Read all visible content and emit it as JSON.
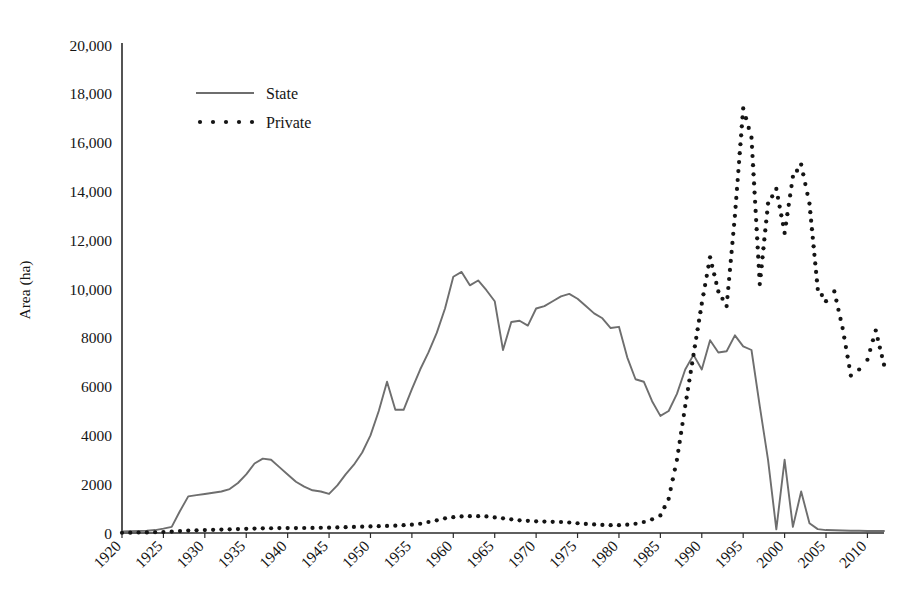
{
  "chart_data": {
    "type": "line",
    "title": "",
    "xlabel": "",
    "ylabel": "Area (ha)",
    "xlim": [
      1920,
      2012
    ],
    "ylim": [
      0,
      20000
    ],
    "grid": false,
    "legend_position": "top-left",
    "y_ticks": [
      0,
      2000,
      4000,
      6000,
      8000,
      10000,
      12000,
      14000,
      16000,
      18000,
      20000
    ],
    "y_tick_labels": [
      "0",
      "2000",
      "4000",
      "6000",
      "8000",
      "10,000",
      "12,000",
      "14,000",
      "16,000",
      "18,000",
      "20,000"
    ],
    "x_ticks": [
      1920,
      1925,
      1930,
      1935,
      1940,
      1945,
      1950,
      1955,
      1960,
      1965,
      1970,
      1975,
      1980,
      1985,
      1990,
      1995,
      2000,
      2005,
      2010
    ],
    "x_tick_labels": [
      "1920",
      "1925",
      "1930",
      "1935",
      "1940",
      "1945",
      "1950",
      "1955",
      "1960",
      "1965",
      "1970",
      "1975",
      "1980",
      "1985",
      "1990",
      "1995",
      "2000",
      "2005",
      "2010"
    ],
    "x": [
      1920,
      1921,
      1922,
      1923,
      1924,
      1925,
      1926,
      1927,
      1928,
      1929,
      1930,
      1931,
      1932,
      1933,
      1934,
      1935,
      1936,
      1937,
      1938,
      1939,
      1940,
      1941,
      1942,
      1943,
      1944,
      1945,
      1946,
      1947,
      1948,
      1949,
      1950,
      1951,
      1952,
      1953,
      1954,
      1955,
      1956,
      1957,
      1958,
      1959,
      1960,
      1961,
      1962,
      1963,
      1964,
      1965,
      1966,
      1967,
      1968,
      1969,
      1970,
      1971,
      1972,
      1973,
      1974,
      1975,
      1976,
      1977,
      1978,
      1979,
      1980,
      1981,
      1982,
      1983,
      1984,
      1985,
      1986,
      1987,
      1988,
      1989,
      1990,
      1991,
      1992,
      1993,
      1994,
      1995,
      1996,
      1997,
      1998,
      1999,
      2000,
      2001,
      2002,
      2003,
      2004,
      2005,
      2006,
      2007,
      2008,
      2009,
      2010,
      2011,
      2012
    ],
    "series": [
      {
        "name": "State",
        "style": "solid",
        "color": "#6e6e6e",
        "values": [
          60,
          70,
          80,
          90,
          120,
          180,
          250,
          900,
          1500,
          1550,
          1600,
          1650,
          1700,
          1800,
          2050,
          2400,
          2850,
          3050,
          3000,
          2700,
          2400,
          2100,
          1900,
          1750,
          1700,
          1600,
          1950,
          2400,
          2800,
          3300,
          4000,
          5000,
          6200,
          5050,
          5050,
          5900,
          6700,
          7400,
          8200,
          9200,
          10500,
          10700,
          10150,
          10350,
          9950,
          9500,
          7500,
          8650,
          8700,
          8500,
          9200,
          9300,
          9500,
          9700,
          9800,
          9600,
          9300,
          9000,
          8800,
          8400,
          8450,
          7200,
          6300,
          6200,
          5400,
          4800,
          5000,
          5700,
          6700,
          7300,
          6700,
          7900,
          7400,
          7450,
          8100,
          7650,
          7500,
          5200,
          3000,
          150,
          3000,
          250,
          1700,
          400,
          160,
          120,
          110,
          100,
          95,
          90,
          85,
          80,
          80
        ]
      },
      {
        "name": "Private",
        "style": "dotted",
        "color": "#141414",
        "values": [
          10,
          15,
          20,
          25,
          30,
          40,
          60,
          80,
          100,
          110,
          120,
          130,
          140,
          150,
          160,
          170,
          180,
          190,
          195,
          200,
          200,
          200,
          205,
          210,
          215,
          220,
          230,
          240,
          250,
          260,
          270,
          280,
          290,
          300,
          320,
          340,
          380,
          450,
          520,
          600,
          650,
          680,
          690,
          690,
          680,
          640,
          600,
          560,
          520,
          500,
          480,
          470,
          460,
          450,
          430,
          400,
          370,
          350,
          330,
          320,
          320,
          340,
          380,
          450,
          560,
          720,
          1400,
          3000,
          5200,
          7300,
          9400,
          11300,
          9900,
          9300,
          13000,
          17400,
          16200,
          10200,
          13500,
          14100,
          12300,
          14600,
          15100,
          13500,
          10000,
          9500,
          9900,
          8400,
          6450,
          6700,
          7100,
          8300,
          6900
        ]
      }
    ]
  },
  "legend": {
    "items": [
      {
        "label": "State",
        "marker": "solid-line"
      },
      {
        "label": "Private",
        "marker": "dotted-line"
      }
    ]
  },
  "axis_titles": {
    "y": "Area (ha)"
  }
}
